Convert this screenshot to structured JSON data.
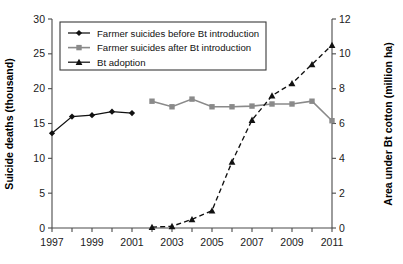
{
  "chart_data": {
    "type": "line",
    "title": "",
    "subtitle": "",
    "xlabel": "",
    "ylabel": "Suicide deaths (thousand)",
    "y2label": "Area under Bt cotton (million ha)",
    "x": [
      1997,
      1998,
      1999,
      2000,
      2001,
      2002,
      2003,
      2004,
      2005,
      2006,
      2007,
      2008,
      2009,
      2010,
      2011
    ],
    "xtick_labels": [
      "1997",
      "1999",
      "2001",
      "2003",
      "2005",
      "2007",
      "2009",
      "2011"
    ],
    "xtick_values": [
      1997,
      1999,
      2001,
      2003,
      2005,
      2007,
      2009,
      2011
    ],
    "xlim": [
      1996.5,
      2011.5
    ],
    "ylim": [
      0,
      30
    ],
    "ytick_labels": [
      "0",
      "5",
      "10",
      "15",
      "20",
      "25",
      "30"
    ],
    "ytick_values": [
      0,
      5,
      10,
      15,
      20,
      25,
      30
    ],
    "y2lim": [
      0,
      12
    ],
    "y2tick_labels": [
      "0",
      "2",
      "4",
      "6",
      "8",
      "10",
      "12"
    ],
    "y2tick_values": [
      0,
      2,
      4,
      6,
      8,
      10,
      12
    ],
    "grid": false,
    "legend_position": "top-left",
    "series": [
      {
        "name": "Farmer suicides before Bt introduction",
        "axis": "left",
        "marker": "diamond",
        "color": "#111111",
        "linestyle": "solid",
        "x": [
          1997,
          1998,
          1999,
          2000,
          2001
        ],
        "values": [
          13.6,
          16.0,
          16.2,
          16.7,
          16.5
        ]
      },
      {
        "name": "Farmer suicides after Bt introduction",
        "axis": "left",
        "marker": "square",
        "color": "#8a8a8a",
        "linestyle": "solid",
        "x": [
          2002,
          2003,
          2004,
          2005,
          2006,
          2007,
          2008,
          2009,
          2010,
          2011
        ],
        "values": [
          18.2,
          17.4,
          18.5,
          17.4,
          17.4,
          17.5,
          17.8,
          17.8,
          18.2,
          15.4
        ]
      },
      {
        "name": "Bt adoption",
        "axis": "right",
        "marker": "triangle",
        "color": "#111111",
        "linestyle": "dashed",
        "x": [
          2002,
          2003,
          2004,
          2005,
          2006,
          2007,
          2008,
          2009,
          2010,
          2011
        ],
        "values": [
          0.05,
          0.1,
          0.5,
          1.0,
          3.8,
          6.2,
          7.6,
          8.3,
          9.4,
          10.5
        ]
      }
    ]
  },
  "axes": {
    "left_title": "Suicide deaths (thousand)",
    "right_title": "Area under Bt cotton (million ha)"
  },
  "legend": {
    "items": [
      {
        "label": "Farmer suicides before Bt introduction",
        "marker": "diamond-marker",
        "color": "#111111"
      },
      {
        "label": "Farmer suicides after Bt introduction",
        "marker": "square-marker",
        "color": "#8a8a8a"
      },
      {
        "label": "Bt adoption",
        "marker": "triangle-marker",
        "color": "#111111"
      }
    ]
  },
  "colors": {
    "before_series": "#111111",
    "after_series": "#8a8a8a",
    "bt_series": "#111111",
    "axis": "#4a4a4a",
    "background": "#ffffff"
  }
}
